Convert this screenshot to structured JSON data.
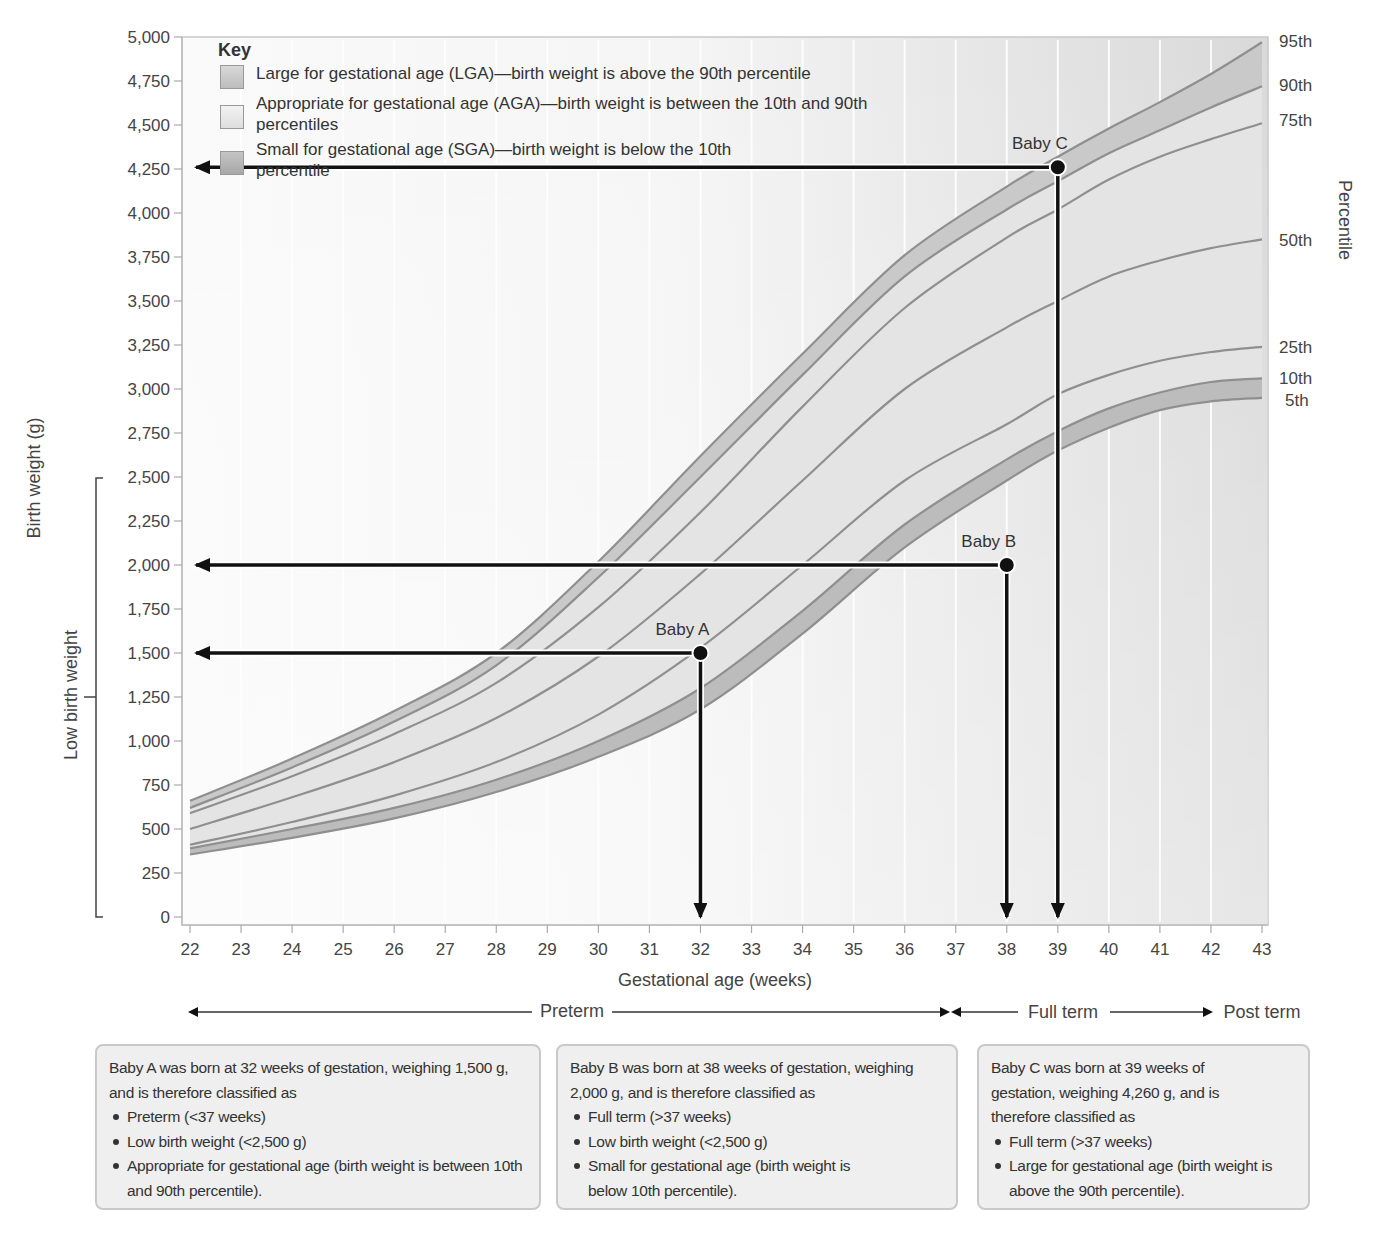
{
  "chart_data": {
    "type": "line",
    "title": "",
    "xlabel": "Gestational age (weeks)",
    "ylabel": "Birth weight (g)",
    "right_axis_label": "Percentile",
    "xlim": [
      22,
      43
    ],
    "ylim": [
      0,
      5000
    ],
    "x_ticks": [
      22,
      23,
      24,
      25,
      26,
      27,
      28,
      29,
      30,
      31,
      32,
      33,
      34,
      35,
      36,
      37,
      38,
      39,
      40,
      41,
      42,
      43
    ],
    "y_ticks": [
      0,
      250,
      500,
      750,
      1000,
      1250,
      1500,
      1750,
      2000,
      2250,
      2500,
      2750,
      3000,
      3250,
      3500,
      3750,
      4000,
      4250,
      4500,
      4750,
      5000
    ],
    "y_tick_labels": [
      "0",
      "250",
      "500",
      "750",
      "1,000",
      "1,250",
      "1,500",
      "1,750",
      "2,000",
      "2,250",
      "2,500",
      "2,750",
      "3,000",
      "3,250",
      "3,500",
      "3,750",
      "4,000",
      "4,250",
      "4,500",
      "4,750",
      "5,000"
    ],
    "grid": "vertical white lines at each week",
    "x": [
      22,
      24,
      26,
      28,
      30,
      32,
      34,
      36,
      38,
      39,
      40,
      41,
      42,
      43
    ],
    "series": [
      {
        "name": "95th",
        "values": [
          660,
          900,
          1170,
          1500,
          2020,
          2620,
          3200,
          3760,
          4150,
          4320,
          4480,
          4630,
          4790,
          4970
        ]
      },
      {
        "name": "90th",
        "values": [
          620,
          850,
          1110,
          1430,
          1930,
          2500,
          3080,
          3640,
          4020,
          4180,
          4340,
          4470,
          4600,
          4720
        ]
      },
      {
        "name": "75th",
        "values": [
          590,
          800,
          1040,
          1330,
          1760,
          2300,
          2900,
          3460,
          3860,
          4020,
          4190,
          4320,
          4420,
          4510
        ]
      },
      {
        "name": "50th",
        "values": [
          500,
          680,
          880,
          1130,
          1480,
          1950,
          2480,
          3000,
          3350,
          3500,
          3640,
          3730,
          3800,
          3850
        ]
      },
      {
        "name": "25th",
        "values": [
          410,
          540,
          690,
          880,
          1150,
          1530,
          2000,
          2480,
          2800,
          2970,
          3080,
          3160,
          3210,
          3240
        ]
      },
      {
        "name": "10th",
        "values": [
          390,
          500,
          620,
          780,
          1000,
          1300,
          1740,
          2230,
          2600,
          2760,
          2890,
          2980,
          3040,
          3060
        ]
      },
      {
        "name": "5th",
        "values": [
          355,
          450,
          560,
          710,
          910,
          1180,
          1610,
          2100,
          2480,
          2650,
          2780,
          2880,
          2930,
          2950
        ]
      }
    ],
    "bands": [
      {
        "name": "LGA",
        "between": [
          "90th",
          "95th"
        ]
      },
      {
        "name": "AGA",
        "between": [
          "10th",
          "90th"
        ]
      },
      {
        "name": "SGA",
        "between": [
          "5th",
          "10th"
        ]
      }
    ],
    "points": [
      {
        "label": "Baby A",
        "x": 32,
        "y": 1500
      },
      {
        "label": "Baby B",
        "x": 38,
        "y": 2000
      },
      {
        "label": "Baby C",
        "x": 39,
        "y": 4260
      }
    ],
    "annotations": [
      "Low birth weight (0–2,500 g bracket)",
      "Preterm",
      "Full term",
      "Post term"
    ],
    "legend_position": "top-left inside plot"
  },
  "axes": {
    "y_title": "Birth weight (g)",
    "x_title": "Gestational age (weeks)",
    "right_title": "Percentile",
    "low_birth_weight_label": "Low birth weight",
    "percentile_labels": [
      "95th",
      "90th",
      "75th",
      "50th",
      "25th",
      "10th",
      "5th"
    ]
  },
  "key": {
    "title": "Key",
    "items": [
      {
        "label": "Large for gestational age (LGA)—birth weight is above the 90th percentile",
        "color": "#c8c8c8"
      },
      {
        "label": "Appropriate for gestational age (AGA)—birth weight is between the 10th and 90th percentiles",
        "color": "#e6e6e6"
      },
      {
        "label": "Small for gestational age (SGA)—birth weight is below the 10th percentile",
        "color": "#bdbdbd"
      }
    ]
  },
  "terms": {
    "preterm": "Preterm",
    "full_term": "Full term",
    "post_term": "Post term"
  },
  "info_boxes": [
    {
      "intro": "Baby A was born at 32 weeks of gestation, weighing 1,500 g, and is therefore classified as",
      "bullets": [
        "Preterm (<37 weeks)",
        "Low birth weight (<2,500 g)",
        "Appropriate for gestational age (birth weight is between 10th and 90th percentile)."
      ]
    },
    {
      "intro": "Baby B was born at 38 weeks of gestation, weighing 2,000 g, and is therefore classified as",
      "bullets": [
        "Full term (>37 weeks)",
        "Low birth weight (<2,500 g)",
        "Small for gestational age (birth weight is below 10th percentile)."
      ]
    },
    {
      "intro": "Baby C was born at 39 weeks of gestation, weighing 4,260 g, and is therefore classified as",
      "bullets": [
        "Full term (>37 weeks)",
        "Large for gestational age (birth weight is above the 90th percentile)."
      ]
    }
  ],
  "colors": {
    "band_lga": "#c9c9c9",
    "band_aga": "#e4e4e4",
    "band_sga": "#bcbcbc",
    "curve": "#8f8f8f",
    "arrow": "#111111"
  }
}
